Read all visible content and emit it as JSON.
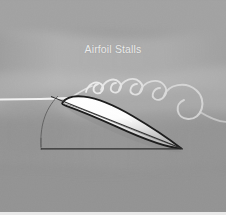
{
  "figure": {
    "title": "Airfoil Stalls",
    "width": 226,
    "height": 215,
    "background_color": "#9b9b9b",
    "title_color": "#ebebeb",
    "bottom_strip_color": "#e9e9e9"
  },
  "background": {
    "base_color": "#9b9b9b",
    "bands": [
      {
        "name": "upper-band",
        "color": "#a3a3a3",
        "opacity": 0.55
      },
      {
        "name": "mid-light-band",
        "color": "#b4b4b4",
        "opacity": 0.5
      },
      {
        "name": "lower-band",
        "color": "#949494",
        "opacity": 0.5
      },
      {
        "name": "bottom-band",
        "color": "#8e8e8e",
        "opacity": 0.45
      }
    ],
    "noise_opacity": 0.16
  },
  "flow": {
    "streamline_color": "#f2f2f2",
    "streamline_width": 2.0,
    "inflow_label": "freestream-streamline",
    "vortex_label": "separated-flow-vortex",
    "vortex_count": 5,
    "vortex_colors": [
      "#ececec",
      "#e4e4e4",
      "#dedede",
      "#d8d8d8",
      "#d2d2d2"
    ]
  },
  "airfoil": {
    "name": "stalled-airfoil",
    "fill_color": "#fbfbfb",
    "outline_color": "#1d1d1d",
    "outline_width": 1.9,
    "camber_line_color": "#555555",
    "shadow_color": "#8a8a8a"
  },
  "geometry": {
    "chord_line_color": "#2a2a2a",
    "chord_line_width": 1.1,
    "baseline_color": "#2a2a2a",
    "baseline_width": 1.2,
    "angle_arc_color": "#555555",
    "angle_arc_width": 1.0,
    "vertical_tick_color": "#555555"
  }
}
